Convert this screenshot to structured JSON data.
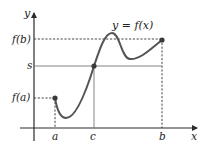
{
  "diagram": {
    "curve_label": "y = f(x)",
    "axes": {
      "x_label": "x",
      "y_label": "y"
    },
    "x_ticks": {
      "a": "a",
      "c": "c",
      "b": "b"
    },
    "y_ticks": {
      "fb": "f(b)",
      "s": "s",
      "fa": "f(a)"
    },
    "points": [
      {
        "name": "A",
        "label": "(a, f(a))"
      },
      {
        "name": "C",
        "label": "(c, s)"
      },
      {
        "name": "B",
        "label": "(b, f(b))"
      }
    ],
    "colors": {
      "curve": "#555555",
      "axis": "#2a2a2a",
      "point": "#3a3a3a"
    }
  }
}
